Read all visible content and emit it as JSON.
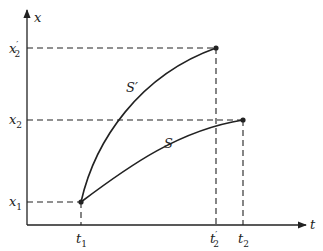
{
  "diagram": {
    "axes": {
      "x_axis_label": "t",
      "y_axis_label": "x"
    },
    "y_ticks": [
      {
        "label": "x",
        "sub": "2",
        "prime": "′"
      },
      {
        "label": "x",
        "sub": "2",
        "prime": ""
      },
      {
        "label": "x",
        "sub": "1",
        "prime": ""
      }
    ],
    "x_ticks": [
      {
        "label": "t",
        "sub": "1",
        "prime": ""
      },
      {
        "label": "t",
        "sub": "2",
        "prime": "′"
      },
      {
        "label": "t",
        "sub": "2",
        "prime": ""
      }
    ],
    "curves": [
      {
        "name": "S′",
        "from": "(t1, x1)",
        "to": "(t2′, x2′)"
      },
      {
        "name": "S",
        "from": "(t1, x1)",
        "to": "(t2, x2)"
      }
    ],
    "colors": {
      "ink": "#222222",
      "background": "#ffffff"
    }
  }
}
